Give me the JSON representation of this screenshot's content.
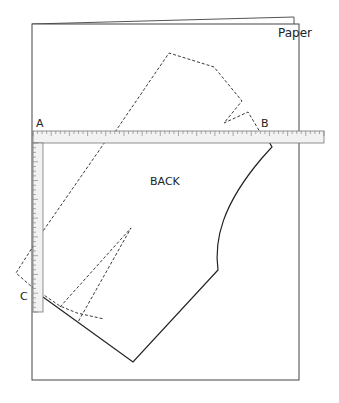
{
  "labels": {
    "paper": "Paper",
    "back": "BACK",
    "point_a": "A",
    "point_b": "B",
    "point_c": "C"
  },
  "colors": {
    "line": "#222222",
    "paper_edge": "#444444",
    "ruler_fill": "#f2f2f2",
    "ruler_edge": "#777777"
  },
  "ruler": {
    "horizontal_ticks": 64,
    "vertical_ticks": 36
  }
}
